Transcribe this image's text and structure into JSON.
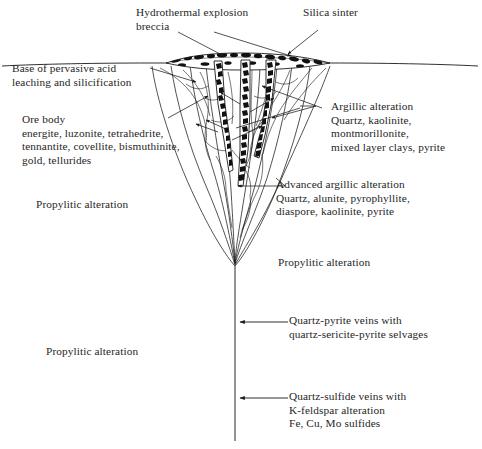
{
  "figure": {
    "type": "geological-cross-section",
    "background_color": "#ffffff",
    "line_color": "#1a1a1a",
    "text_color": "#262626"
  },
  "labels": {
    "hydrothermal_breccia": "Hydrothermal explosion\nbreccia",
    "silica_sinter": "Silica sinter",
    "base_acid_leaching": "Base of pervasive acid\nleaching and silicification",
    "ore_body": "Ore body\nenergite, luzonite, tetrahedrite,\ntennantite, covellite, bismuthinite,\ngold, tellurides",
    "argillic": "Argillic alteration\nQuartz, kaolinite,\nmontmorillonite,\nmixed layer clays, pyrite",
    "advanced_argillic": "Advanced argillic alteration\nQuartz, alunite, pyrophyllite,\ndiaspore, kaolinite, pyrite",
    "propylitic_left_upper": "Propylitic alteration",
    "propylitic_right": "Propylitic alteration",
    "propylitic_left_lower": "Propylitic alteration",
    "quartz_pyrite_veins": "Quartz-pyrite veins with\nquartz-sericite-pyrite selvages",
    "quartz_sulfide_veins": "Quartz-sulfide veins with\nK-feldspar alteration\nFe, Cu, Mo sulfides"
  },
  "structures": {
    "ground_surface": "ground-surface-line",
    "sinter_apron": "silica-sinter-apron",
    "breccia_pipes": "hydrothermal-breccia-pipes",
    "alteration_funnel": "funnel-shaped-alteration-envelope",
    "deep_vein_stem": "deep-vertical-vein-stem"
  }
}
